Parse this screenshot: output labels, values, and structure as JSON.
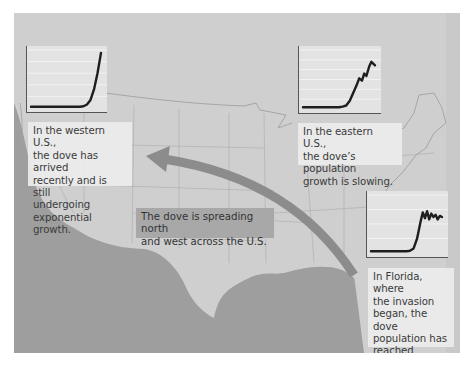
{
  "figure": {
    "colors": {
      "background": "#ffffff",
      "ocean": "#9e9e9e",
      "land": "#cfcfcf",
      "land_east": "#c8c8c8",
      "state_lines": "#a9a9a9",
      "arrow": "#8c8c8c",
      "chart_bg": "#e3e3e3",
      "chart_line": "#1e1e1e",
      "callout_bg": "#ececec",
      "center_label_bg": "#a8a8a8",
      "text": "#3a3a3a"
    },
    "callouts": {
      "west": {
        "lines": [
          "In the western U.S.,",
          "the dove has arrived",
          "recently and is still",
          "undergoing",
          "exponential growth."
        ]
      },
      "east": {
        "lines": [
          "In the eastern U.S.,",
          "the dove’s population",
          "growth is slowing."
        ]
      },
      "florida": {
        "lines": [
          "In Florida, where",
          "the invasion",
          "began, the dove",
          "population has",
          "reached carrying",
          "capacity."
        ]
      },
      "center": {
        "lines": [
          "The dove is spreading north",
          "and west across the U.S."
        ]
      }
    },
    "arrow": {
      "label": "spread-direction",
      "from": "Florida (southeast)",
      "to": "western U.S."
    }
  },
  "chart_data": [
    {
      "type": "line",
      "title": "",
      "region": "western U.S.",
      "xlabel": "",
      "ylabel": "",
      "grid": true,
      "gridlines_y": 5,
      "description": "exponential growth",
      "x": [
        0,
        10,
        20,
        30,
        40,
        50,
        60,
        70,
        75,
        80,
        85,
        90,
        95,
        100
      ],
      "values": [
        2,
        2,
        2,
        2,
        2,
        2,
        2,
        2,
        3,
        6,
        14,
        32,
        60,
        95
      ]
    },
    {
      "type": "line",
      "title": "",
      "region": "eastern U.S.",
      "xlabel": "",
      "ylabel": "",
      "grid": true,
      "gridlines_y": 6,
      "description": "growth slowing",
      "x": [
        0,
        10,
        20,
        30,
        40,
        50,
        55,
        60,
        65,
        70,
        75,
        78,
        82,
        85,
        88,
        92,
        95,
        100
      ],
      "values": [
        3,
        3,
        3,
        3,
        3,
        3,
        4,
        6,
        14,
        28,
        42,
        52,
        48,
        60,
        56,
        72,
        80,
        74
      ]
    },
    {
      "type": "line",
      "title": "",
      "region": "Florida",
      "xlabel": "",
      "ylabel": "",
      "grid": true,
      "gridlines_y": 4,
      "description": "reached carrying capacity",
      "x": [
        0,
        10,
        20,
        30,
        40,
        50,
        55,
        60,
        65,
        70,
        73,
        76,
        79,
        82,
        85,
        88,
        91,
        94,
        97,
        100
      ],
      "values": [
        3,
        3,
        3,
        3,
        3,
        3,
        4,
        8,
        25,
        55,
        70,
        60,
        72,
        58,
        68,
        62,
        66,
        58,
        64,
        62
      ]
    }
  ]
}
